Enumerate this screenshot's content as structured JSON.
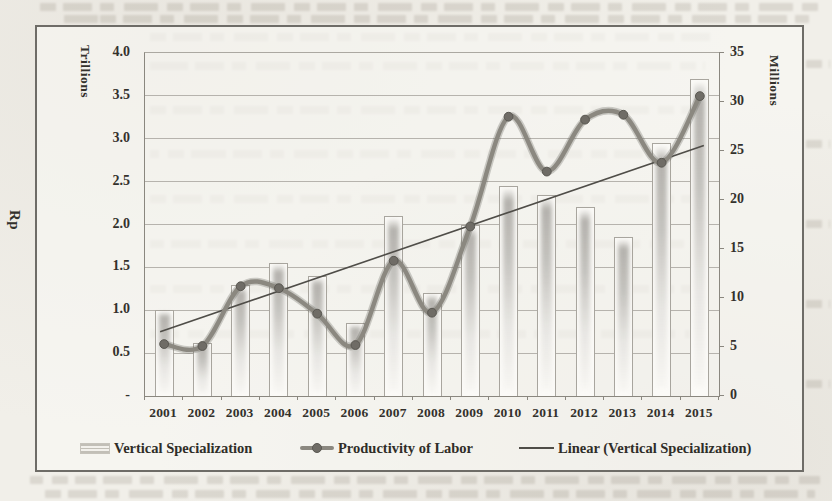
{
  "chart_data": {
    "type": "bar",
    "subtype": "combo-bar-line-with-trendline",
    "categories": [
      "2001",
      "2002",
      "2003",
      "2004",
      "2005",
      "2006",
      "2007",
      "2008",
      "2009",
      "2010",
      "2011",
      "2012",
      "2013",
      "2014",
      "2015"
    ],
    "series": [
      {
        "name": "Vertical Specialization",
        "type": "bar",
        "axis": "left",
        "values": [
          1.0,
          0.62,
          1.3,
          1.55,
          1.4,
          0.85,
          2.1,
          1.2,
          2.0,
          2.45,
          2.35,
          2.2,
          1.85,
          2.95,
          3.7
        ]
      },
      {
        "name": "Productivity of Labor",
        "type": "line",
        "axis": "right",
        "values": [
          5.3,
          5.1,
          11.2,
          11.0,
          8.4,
          5.2,
          13.8,
          8.5,
          17.3,
          28.5,
          22.9,
          28.2,
          28.7,
          23.8,
          30.6
        ]
      },
      {
        "name": "Linear (Vertical Specialization)",
        "type": "trendline",
        "axis": "left",
        "endpoints": [
          0.75,
          2.92
        ]
      }
    ],
    "left_axis": {
      "label": "Rp",
      "units": "Trillions",
      "min": 0,
      "max": 4,
      "grid_step": 0.5,
      "tick_labels": [
        "4.0",
        "3.5",
        "3.0",
        "2.5",
        "2.0",
        "1.5",
        "1.0",
        "0.5",
        "-"
      ]
    },
    "right_axis": {
      "label": "Millions",
      "min": 0,
      "max": 35,
      "tick_step": 5,
      "tick_labels": [
        "35",
        "30",
        "25",
        "20",
        "15",
        "10",
        "5",
        "0"
      ]
    },
    "grid": "horizontal gridlines every 0.5 (left axis)",
    "legend_position": "bottom"
  },
  "colors": {
    "paper": "#f1efe9",
    "figure_border": "#6e6c67",
    "gridline": "#b6b3ad",
    "axis_line": "#8a877f",
    "bar_fill": "#fbfaf7",
    "bar_outline": "#a9a69f",
    "line": "#8b8880",
    "marker": "#6f6c66",
    "trendline": "#4f4d48",
    "text": "#33312c"
  }
}
